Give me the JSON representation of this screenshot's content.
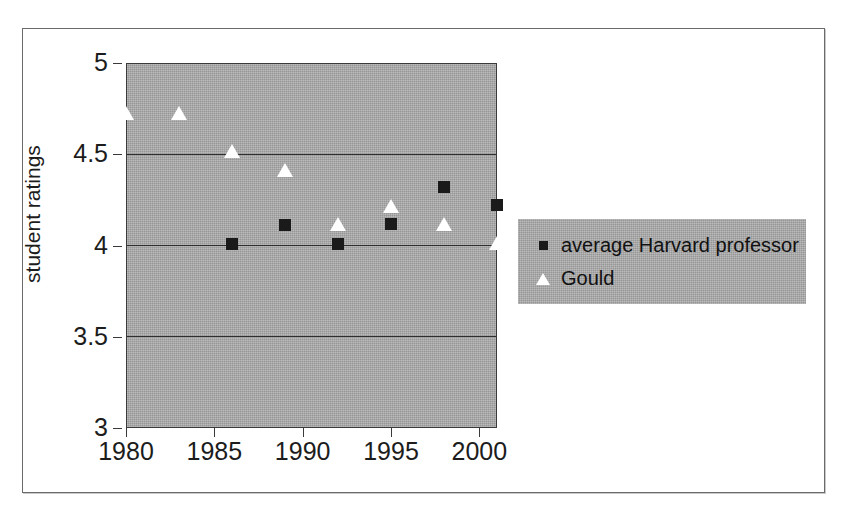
{
  "chart_data": {
    "type": "scatter",
    "title": "",
    "xlabel": "",
    "ylabel": "student ratings",
    "xlim": [
      1980,
      2001
    ],
    "ylim": [
      3,
      5
    ],
    "grid": true,
    "legend_position": "right",
    "x_ticks": [
      "1980",
      "1985",
      "1990",
      "1995",
      "2000"
    ],
    "x_tick_values": [
      1980,
      1985,
      1990,
      1995,
      2000
    ],
    "y_ticks": [
      "3",
      "3.5",
      "4",
      "4.5",
      "5"
    ],
    "y_tick_values": [
      3,
      3.5,
      4,
      4.5,
      5
    ],
    "series": [
      {
        "name": "average Harvard professor",
        "marker": "square",
        "marker_color": "#1a1a1a",
        "points": [
          {
            "x": 1986,
            "y": 4.01
          },
          {
            "x": 1989,
            "y": 4.11
          },
          {
            "x": 1992,
            "y": 4.01
          },
          {
            "x": 1995,
            "y": 4.12
          },
          {
            "x": 1998,
            "y": 4.32
          },
          {
            "x": 2001,
            "y": 4.22
          }
        ]
      },
      {
        "name": "Gould",
        "marker": "triangle",
        "marker_color": "#ffffff",
        "points": [
          {
            "x": 1980,
            "y": 4.72
          },
          {
            "x": 1983,
            "y": 4.72
          },
          {
            "x": 1986,
            "y": 4.51
          },
          {
            "x": 1989,
            "y": 4.41
          },
          {
            "x": 1992,
            "y": 4.11
          },
          {
            "x": 1995,
            "y": 4.21
          },
          {
            "x": 1998,
            "y": 4.11
          },
          {
            "x": 2001,
            "y": 4.01
          }
        ]
      }
    ],
    "plot_background_color": "#a8a8a8",
    "figure_background_color": "#ffffff"
  },
  "legend": {
    "items": [
      {
        "label": "average Harvard professor",
        "marker": "square-marker-icon"
      },
      {
        "label": "Gould",
        "marker": "triangle-marker-icon"
      }
    ]
  }
}
